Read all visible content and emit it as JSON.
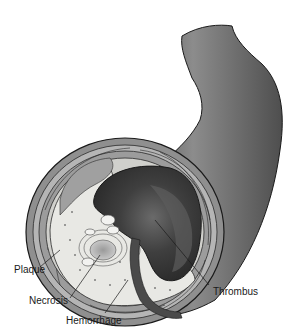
{
  "figure": {
    "labels": {
      "plaque": "Plaque",
      "necrosis": "Necrosis",
      "hemorrhage": "Hemorrhage",
      "thrombus": "Thrombus"
    },
    "colors": {
      "vessel_outer": "#5a5a5a",
      "vessel_highlight": "#8a8a8a",
      "wall_layer": "#9a9a9a",
      "lumen": "#3e3e3e",
      "plaque_fill": "#e6e6e2",
      "necrotic_core": "#a8a8a8",
      "outline": "#1a1a1a"
    }
  }
}
